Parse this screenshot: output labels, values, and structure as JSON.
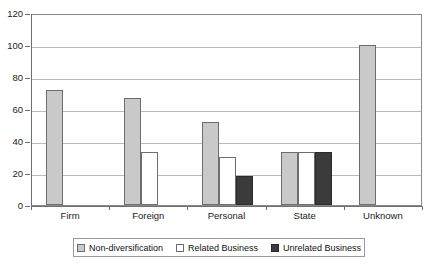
{
  "chart_data": {
    "type": "bar",
    "title": "",
    "xlabel": "",
    "ylabel": "",
    "ylim": [
      0,
      120
    ],
    "ytick_step": 20,
    "ytick_labels": [
      "0",
      "20",
      "40",
      "60",
      "80",
      "100",
      "120"
    ],
    "grid": true,
    "legend_position": "bottom",
    "categories": [
      "Firm",
      "Foreign",
      "Personal",
      "State",
      "Unknown"
    ],
    "series": [
      {
        "name": "Non-diversification",
        "color": "#c9c9c9",
        "values": [
          72,
          67,
          52,
          33.3,
          100
        ]
      },
      {
        "name": "Related Business",
        "color": "#ffffff",
        "values": [
          0,
          33.3,
          30,
          33.3,
          0
        ]
      },
      {
        "name": "Unrelated Business",
        "color": "#3b3b3b",
        "values": [
          0,
          0,
          18,
          33.3,
          0
        ]
      }
    ]
  },
  "axis": {
    "y_labels": [
      "120",
      "100",
      "80",
      "60",
      "40",
      "20",
      "0"
    ]
  },
  "legend": {
    "items": [
      {
        "label": "Non-diversification"
      },
      {
        "label": "Related Business"
      },
      {
        "label": "Unrelated Business"
      }
    ]
  },
  "title_strip": {
    "text": ""
  }
}
